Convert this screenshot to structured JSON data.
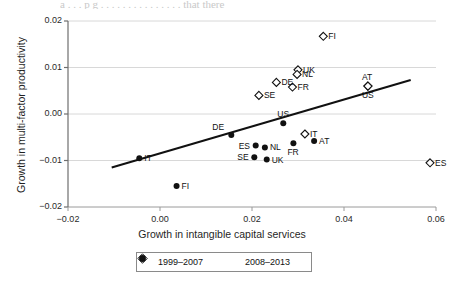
{
  "figure": {
    "top_clipped_text": "a  . . . p  g . . . . . .  . . . . . . . . .  that there"
  },
  "chart_data": {
    "type": "scatter",
    "title": "",
    "xlabel": "Growth in intangible capital services",
    "ylabel": "Growth in multi-factor productivity",
    "xlim": [
      -0.02,
      0.06
    ],
    "ylim": [
      -0.02,
      0.02
    ],
    "xticks": [
      "-0.02",
      "0.00",
      "0.02",
      "0.04",
      "0.06"
    ],
    "yticks": [
      "0.02",
      "0.01",
      "0.00",
      "-0.01",
      "-0.02"
    ],
    "xtick_values": [
      -0.02,
      0.0,
      0.02,
      0.04,
      0.06
    ],
    "ytick_values": [
      0.02,
      0.01,
      0.0,
      -0.01,
      -0.02
    ],
    "grid": "horizontal",
    "legend_position": "bottom-center",
    "series": [
      {
        "name": "1999–2007",
        "marker": "open-diamond",
        "color": "#111111",
        "points": [
          {
            "label": "FI",
            "x": 0.0355,
            "y": 0.0167,
            "label_pos": "right"
          },
          {
            "label": "UK",
            "x": 0.03,
            "y": 0.0095,
            "label_pos": "right"
          },
          {
            "label": "NL",
            "x": 0.0298,
            "y": 0.0085,
            "label_pos": "right"
          },
          {
            "label": "DE",
            "x": 0.0253,
            "y": 0.0068,
            "label_pos": "right"
          },
          {
            "label": "FR",
            "x": 0.0288,
            "y": 0.0058,
            "label_pos": "right"
          },
          {
            "label": "SE",
            "x": 0.0215,
            "y": 0.004,
            "label_pos": "right"
          },
          {
            "label": "AT",
            "x": 0.0452,
            "y": 0.006,
            "label_pos": "above"
          },
          {
            "label": "US",
            "x": 0.0452,
            "y": 0.006,
            "label_pos": "below"
          },
          {
            "label": "IT",
            "x": 0.0315,
            "y": -0.0043,
            "label_pos": "right"
          },
          {
            "label": "ES",
            "x": 0.0587,
            "y": -0.0105,
            "label_pos": "right"
          }
        ]
      },
      {
        "name": "2008–2013",
        "marker": "filled-circle",
        "color": "#111111",
        "points": [
          {
            "label": "US",
            "x": 0.0268,
            "y": -0.002,
            "label_pos": "above"
          },
          {
            "label": "DE",
            "x": 0.0155,
            "y": -0.0045,
            "label_pos": "above-left"
          },
          {
            "label": "ES",
            "x": 0.0208,
            "y": -0.0068,
            "label_pos": "left"
          },
          {
            "label": "NL",
            "x": 0.0228,
            "y": -0.0072,
            "label_pos": "right"
          },
          {
            "label": "FR",
            "x": 0.029,
            "y": -0.0063,
            "label_pos": "below"
          },
          {
            "label": "AT",
            "x": 0.0335,
            "y": -0.0058,
            "label_pos": "right"
          },
          {
            "label": "SE",
            "x": 0.0205,
            "y": -0.0093,
            "label_pos": "left"
          },
          {
            "label": "UK",
            "x": 0.0232,
            "y": -0.0098,
            "label_pos": "right"
          },
          {
            "label": "IT",
            "x": -0.0045,
            "y": -0.0095,
            "label_pos": "right"
          },
          {
            "label": "FI",
            "x": 0.0036,
            "y": -0.0155,
            "label_pos": "right"
          }
        ]
      }
    ],
    "trendline": {
      "x0": -0.0105,
      "y0": -0.0115,
      "x1": 0.0545,
      "y1": 0.0073
    }
  },
  "legend": {
    "entries": [
      {
        "marker": "open-diamond",
        "label": "1999–2007"
      },
      {
        "marker": "filled-circle",
        "label": "2008–2013"
      }
    ]
  }
}
